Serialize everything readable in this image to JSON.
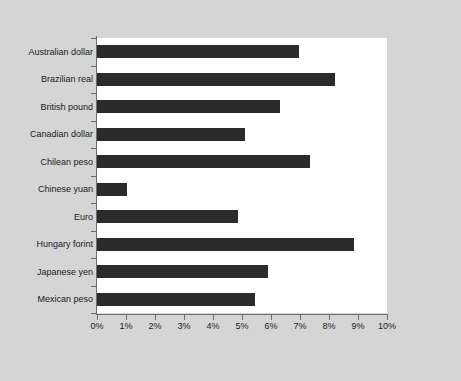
{
  "chart_data": {
    "type": "bar",
    "orientation": "horizontal",
    "title": "",
    "subtitle": "",
    "xlabel": "",
    "ylabel": "",
    "xlim": [
      0,
      10
    ],
    "ylim": null,
    "grid": false,
    "legend": null,
    "legend_position": "none",
    "units": "percent",
    "xtick_labels": [
      "0%",
      "1%",
      "2%",
      "3%",
      "4%",
      "5%",
      "6%",
      "7%",
      "8%",
      "9%",
      "10%"
    ],
    "xtick_values": [
      0,
      1,
      2,
      3,
      4,
      5,
      6,
      7,
      8,
      9,
      10
    ],
    "categories": [
      "Australian dollar",
      "Brazilian real",
      "British pound",
      "Canadian dollar",
      "Chilean peso",
      "Chinese yuan",
      "Euro",
      "Hungary forint",
      "Japanese yen",
      "Mexican peso"
    ],
    "values": [
      6.95,
      8.2,
      6.3,
      5.1,
      7.35,
      1.05,
      4.85,
      8.85,
      5.9,
      5.45
    ],
    "value_labels": [
      "",
      "",
      "",
      "",
      "",
      "",
      "",
      "",
      "",
      ""
    ],
    "series": [
      {
        "name": "",
        "values": [
          6.95,
          8.2,
          6.3,
          5.1,
          7.35,
          1.05,
          4.85,
          8.85,
          5.9,
          5.45
        ]
      }
    ],
    "annotations": []
  },
  "colors": {
    "figure_background": "#d5d5d5",
    "plot_background": "#ffffff",
    "bar": "#2b2b2b",
    "axis": "#6e6e6e",
    "text": "#1a1a1a"
  }
}
